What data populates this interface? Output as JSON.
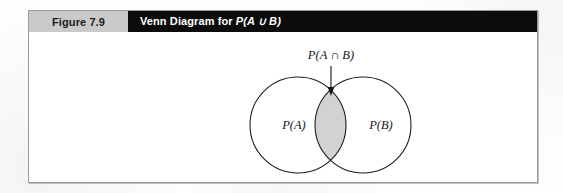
{
  "figure": {
    "number_label": "Figure 7.9",
    "title": "Venn Diagram for P(A ∪ B)",
    "title_prefix": "Venn Diagram for ",
    "title_expression": "P(A ∪ B)"
  },
  "diagram": {
    "type": "venn-diagram",
    "set_count": 2,
    "left_circle_label": "P(A)",
    "right_circle_label": "P(B)",
    "intersection_label": "P(A ∩ B)",
    "intersection_shaded": true,
    "annotation_arrow": "down-arrow",
    "colors": {
      "header_gray": "#c9c9c9",
      "header_black": "#0c0c0c",
      "frame_border": "#9a9a9a",
      "circle_stroke": "#1e1e1e",
      "intersection_fill": "#d2d2d2",
      "page_background": "#ffffff",
      "text": "#161616"
    },
    "geometry": {
      "left_circle": {
        "cx": 269,
        "cy": 93,
        "r": 48
      },
      "right_circle": {
        "cx": 334,
        "cy": 93,
        "r": 48
      },
      "arrow": {
        "x": 302,
        "y_start": 34,
        "y_end": 63
      }
    }
  }
}
